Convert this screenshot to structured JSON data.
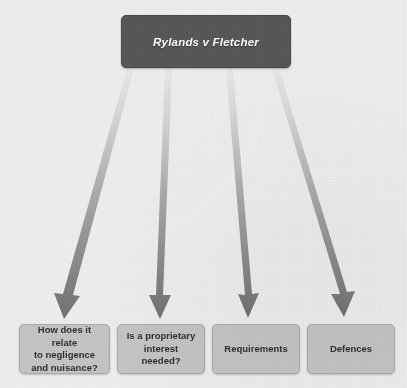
{
  "diagram": {
    "type": "hierarchy-flowchart",
    "background_color": "#eceded",
    "root": {
      "id": "root",
      "label": "Rylands v Fletcher",
      "style": "italic",
      "fill_color": "#555759",
      "text_color": "#ffffff"
    },
    "leaves": [
      {
        "id": "leaf-0",
        "label": "How does it relate\nto negligence\nand nuisance?",
        "fill_color": "#c3c4c4",
        "text_color": "#2e2f30"
      },
      {
        "id": "leaf-1",
        "label": "Is a proprietary\ninterest needed?",
        "fill_color": "#c3c4c4",
        "text_color": "#2e2f30"
      },
      {
        "id": "leaf-2",
        "label": "Requirements",
        "fill_color": "#c3c4c4",
        "text_color": "#2e2f30"
      },
      {
        "id": "leaf-3",
        "label": "Defences",
        "fill_color": "#c3c4c4",
        "text_color": "#2e2f30"
      }
    ],
    "connectors": [
      {
        "id": "connector-0",
        "from": "root",
        "to": "leaf-0",
        "kind": "gradient-arrow",
        "start_color": "#e4e5e5",
        "end_color": "#6f7173"
      },
      {
        "id": "connector-1",
        "from": "root",
        "to": "leaf-1",
        "kind": "gradient-arrow",
        "start_color": "#e4e5e5",
        "end_color": "#6f7173"
      },
      {
        "id": "connector-2",
        "from": "root",
        "to": "leaf-2",
        "kind": "gradient-arrow",
        "start_color": "#e4e5e5",
        "end_color": "#6f7173"
      },
      {
        "id": "connector-3",
        "from": "root",
        "to": "leaf-3",
        "kind": "gradient-arrow",
        "start_color": "#e4e5e5",
        "end_color": "#6f7173"
      }
    ]
  }
}
